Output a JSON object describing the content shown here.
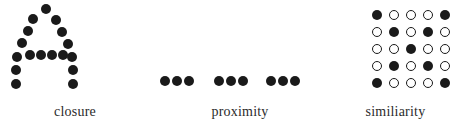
{
  "figure": {
    "background_color": "#ffffff",
    "dot_color": "#1a1a1a",
    "caption_color": "#2b2b2b",
    "width": 461,
    "height": 129
  },
  "panels": [
    {
      "key": "closure",
      "caption": "closure",
      "dot_radius": 5.4,
      "description": "dots arranged along the outline of the capital letter A",
      "dots": [
        {
          "x": 46,
          "y": 9,
          "fill": "filled"
        },
        {
          "x": 33,
          "y": 19,
          "fill": "filled"
        },
        {
          "x": 56,
          "y": 20,
          "fill": "filled"
        },
        {
          "x": 28,
          "y": 31,
          "fill": "filled"
        },
        {
          "x": 62,
          "y": 32,
          "fill": "filled"
        },
        {
          "x": 22,
          "y": 43,
          "fill": "filled"
        },
        {
          "x": 68,
          "y": 44,
          "fill": "filled"
        },
        {
          "x": 17,
          "y": 57,
          "fill": "filled"
        },
        {
          "x": 30,
          "y": 55,
          "fill": "filled"
        },
        {
          "x": 41,
          "y": 55,
          "fill": "filled"
        },
        {
          "x": 52,
          "y": 55,
          "fill": "filled"
        },
        {
          "x": 63,
          "y": 55,
          "fill": "filled"
        },
        {
          "x": 72,
          "y": 57,
          "fill": "filled"
        },
        {
          "x": 16,
          "y": 70,
          "fill": "filled"
        },
        {
          "x": 73,
          "y": 70,
          "fill": "filled"
        },
        {
          "x": 16,
          "y": 84,
          "fill": "filled"
        },
        {
          "x": 73,
          "y": 84,
          "fill": "filled"
        }
      ]
    },
    {
      "key": "proximity",
      "caption": "proximity",
      "dot_radius": 5.0,
      "description": "three separated clusters of three dots each on a single row",
      "dots": [
        {
          "x": 15,
          "y": 81,
          "fill": "filled"
        },
        {
          "x": 27,
          "y": 81,
          "fill": "filled"
        },
        {
          "x": 39,
          "y": 81,
          "fill": "filled"
        },
        {
          "x": 69,
          "y": 81,
          "fill": "filled"
        },
        {
          "x": 81,
          "y": 81,
          "fill": "filled"
        },
        {
          "x": 93,
          "y": 81,
          "fill": "filled"
        },
        {
          "x": 121,
          "y": 81,
          "fill": "filled"
        },
        {
          "x": 133,
          "y": 81,
          "fill": "filled"
        },
        {
          "x": 145,
          "y": 81,
          "fill": "filled"
        }
      ]
    },
    {
      "key": "similarity",
      "caption": "similiarity",
      "dot_radius": 5.0,
      "description": "five by five grid of dots; filled dots form an X, remaining dots are open circles",
      "grid": {
        "rows": 5,
        "columns": 5,
        "origin_x": 47,
        "origin_y": 15,
        "step_x": 17,
        "step_y": 17,
        "pattern": [
          [
            "filled",
            "open",
            "open",
            "open",
            "filled"
          ],
          [
            "open",
            "filled",
            "open",
            "filled",
            "open"
          ],
          [
            "open",
            "open",
            "filled",
            "open",
            "open"
          ],
          [
            "open",
            "filled",
            "open",
            "filled",
            "open"
          ],
          [
            "filled",
            "open",
            "open",
            "open",
            "filled"
          ]
        ]
      }
    }
  ]
}
